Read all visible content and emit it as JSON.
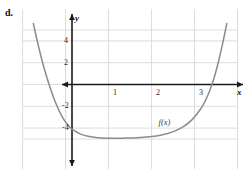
{
  "figure": {
    "item_label": "d.",
    "curve_label": "f(x)",
    "axis_name_x": "x",
    "axis_name_y": "y",
    "colors": {
      "grid": "#d9d9de",
      "axis": "#1a1a1a",
      "curve": "#8c8c8c",
      "background": "#ffffff",
      "text": "#1a1a1a"
    }
  },
  "chart_data": {
    "type": "line",
    "title": "",
    "xlabel": "x",
    "ylabel": "y",
    "grid": true,
    "legend": "inline-annotation",
    "annotations": [
      {
        "text": "d.",
        "position": "top-left-outside"
      },
      {
        "text": "f(x)",
        "x": 2.2,
        "y": -3.5
      }
    ],
    "xlim": [
      -1.15,
      3.8
    ],
    "ylim": [
      -5.6,
      5.7
    ],
    "xticks": [
      1,
      2,
      3
    ],
    "xtick_labels": [
      "1",
      "2",
      "3"
    ],
    "yticks": [
      4,
      2,
      -2,
      -4
    ],
    "ytick_labels": [
      "4",
      "2",
      "-2",
      "-4"
    ],
    "x_gridlines": [
      -1.15,
      -0.15,
      0.85,
      1.85,
      2.85,
      3.85
    ],
    "y_gridlines": [
      5.0,
      4.0,
      2.0,
      0.0,
      -2.0,
      -4.0,
      -5.0
    ],
    "series": [
      {
        "name": "f(x)",
        "x": [
          -0.9,
          -0.8,
          -0.7,
          -0.6,
          -0.5,
          -0.4,
          -0.3,
          -0.2,
          -0.1,
          0.0,
          0.2,
          0.4,
          0.6,
          0.8,
          1.0,
          1.2,
          1.4,
          1.6,
          1.8,
          2.0,
          2.2,
          2.4,
          2.6,
          2.8,
          3.0,
          3.1,
          3.2,
          3.3,
          3.4,
          3.5,
          3.6
        ],
        "y": [
          5.6,
          3.85,
          2.25,
          0.85,
          -0.4,
          -1.5,
          -2.4,
          -3.15,
          -3.7,
          -4.1,
          -4.55,
          -4.78,
          -4.88,
          -4.92,
          -4.93,
          -4.92,
          -4.9,
          -4.86,
          -4.8,
          -4.7,
          -4.52,
          -4.25,
          -3.85,
          -3.2,
          -2.2,
          -1.5,
          -0.6,
          0.55,
          2.0,
          3.7,
          5.6
        ]
      }
    ]
  }
}
